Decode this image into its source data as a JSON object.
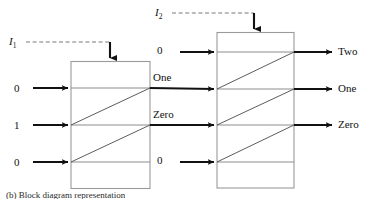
{
  "figure": {
    "type": "block-diagram",
    "caption": "(b) Block diagram representation"
  },
  "control_signals": [
    {
      "name": "I1",
      "base": "I",
      "sub": "1",
      "target": "block-1",
      "style": "dashed"
    },
    {
      "name": "I2",
      "base": "I",
      "sub": "2",
      "target": "block-2",
      "style": "dashed"
    }
  ],
  "blocks": [
    {
      "id": "block-1",
      "rows": [
        {
          "input": "0",
          "output": "One"
        },
        {
          "input": "1",
          "output": "Zero"
        },
        {
          "input": "0",
          "output": ""
        }
      ]
    },
    {
      "id": "block-2",
      "rows": [
        {
          "input": "0",
          "output": "Two"
        },
        {
          "input": "One",
          "output": "One"
        },
        {
          "input": "Zero",
          "output": "Zero"
        },
        {
          "input": "0",
          "output": ""
        }
      ]
    }
  ],
  "labels": {
    "left_inputs": [
      "0",
      "1",
      "0"
    ],
    "middle_top_input": "0",
    "middle_outputs": [
      "One",
      "Zero"
    ],
    "middle_bottom_input": "0",
    "right_outputs": [
      "Two",
      "One",
      "Zero"
    ]
  },
  "colors": {
    "box_stroke": "#9a9a9a",
    "signal_line": "#8c8c8c",
    "arrow": "#111111",
    "dashed": "#7a7a7a",
    "text": "#111111",
    "background": "#ffffff"
  }
}
